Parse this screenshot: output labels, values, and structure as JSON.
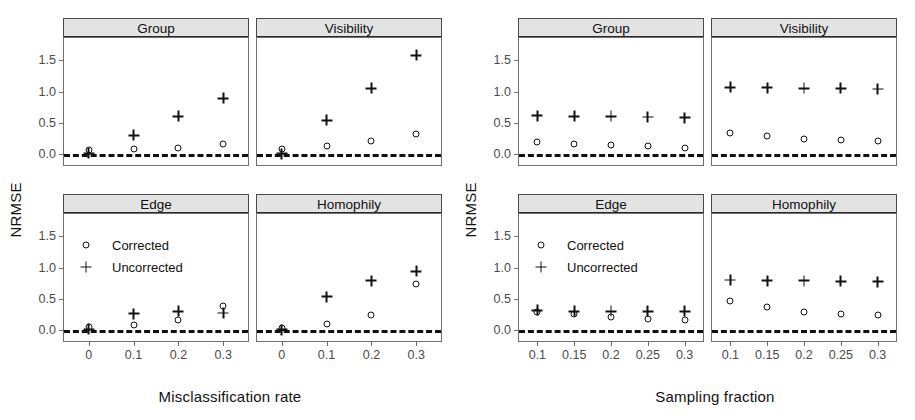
{
  "figure": {
    "width": 915,
    "height": 420,
    "background": "#ffffff",
    "foreground": "#111111",
    "strip_fill": "#e3e3e3"
  },
  "chart_data": [
    {
      "type": "scatter",
      "id": "misclassification",
      "title": "",
      "xlabel": "Misclassification rate",
      "ylabel": "NRMSE",
      "x": [
        0,
        0.1,
        0.2,
        0.3
      ],
      "xticklabels": [
        "0",
        "0.1",
        "0.2",
        "0.3"
      ],
      "yticks": [
        0.0,
        0.5,
        1.0,
        1.5
      ],
      "yticklabels": [
        "0.0",
        "0.5",
        "1.0",
        "1.5"
      ],
      "ylim": [
        -0.18,
        1.86
      ],
      "xlim": [
        -0.055,
        0.355
      ],
      "grid": false,
      "legend_position": "Edge panel, upper left",
      "reference_line": {
        "y": 0,
        "style": "dashed"
      },
      "legend": [
        {
          "label": "Corrected",
          "marker": "circle"
        },
        {
          "label": "Uncorrected",
          "marker": "plus"
        }
      ],
      "panels": [
        {
          "name": "Group",
          "series": [
            {
              "name": "Corrected",
              "marker": "circle",
              "values": [
                0.06,
                0.08,
                0.1,
                0.15
              ]
            },
            {
              "name": "Uncorrected",
              "marker": "plus",
              "values": [
                0.01,
                0.3,
                0.6,
                0.89
              ]
            }
          ]
        },
        {
          "name": "Visibility",
          "series": [
            {
              "name": "Corrected",
              "marker": "circle",
              "values": [
                0.08,
                0.13,
                0.2,
                0.32
              ]
            },
            {
              "name": "Uncorrected",
              "marker": "plus",
              "values": [
                0.0,
                0.54,
                1.05,
                1.58
              ]
            }
          ]
        },
        {
          "name": "Edge",
          "series": [
            {
              "name": "Corrected",
              "marker": "circle",
              "values": [
                0.04,
                0.07,
                0.15,
                0.38
              ]
            },
            {
              "name": "Uncorrected",
              "marker": "plus",
              "values": [
                0.01,
                0.26,
                0.3,
                0.27
              ]
            }
          ]
        },
        {
          "name": "Homophily",
          "series": [
            {
              "name": "Corrected",
              "marker": "circle",
              "values": [
                0.03,
                0.1,
                0.24,
                0.73
              ]
            },
            {
              "name": "Uncorrected",
              "marker": "plus",
              "values": [
                0.0,
                0.53,
                0.79,
                0.94
              ]
            }
          ]
        }
      ]
    },
    {
      "type": "scatter",
      "id": "sampling",
      "title": "",
      "xlabel": "Sampling fraction",
      "ylabel": "NRMSE",
      "x": [
        0.1,
        0.15,
        0.2,
        0.25,
        0.3
      ],
      "xticklabels": [
        "0.1",
        "0.15",
        "0.2",
        "0.25",
        "0.3"
      ],
      "yticks": [
        0.0,
        0.5,
        1.0,
        1.5
      ],
      "yticklabels": [
        "0.0",
        "0.5",
        "1.0",
        "1.5"
      ],
      "ylim": [
        -0.18,
        1.86
      ],
      "xlim": [
        0.075,
        0.325
      ],
      "grid": false,
      "legend_position": "Edge panel, upper left",
      "reference_line": {
        "y": 0,
        "style": "dashed"
      },
      "legend": [
        {
          "label": "Corrected",
          "marker": "circle"
        },
        {
          "label": "Uncorrected",
          "marker": "plus"
        }
      ],
      "panels": [
        {
          "name": "Group",
          "series": [
            {
              "name": "Corrected",
              "marker": "circle",
              "values": [
                0.19,
                0.16,
                0.14,
                0.12,
                0.1
              ]
            },
            {
              "name": "Uncorrected",
              "marker": "plus",
              "values": [
                0.61,
                0.6,
                0.6,
                0.59,
                0.58
              ]
            }
          ]
        },
        {
          "name": "Visibility",
          "series": [
            {
              "name": "Corrected",
              "marker": "circle",
              "values": [
                0.34,
                0.28,
                0.24,
                0.22,
                0.2
              ]
            },
            {
              "name": "Uncorrected",
              "marker": "plus",
              "values": [
                1.07,
                1.06,
                1.05,
                1.05,
                1.04
              ]
            }
          ]
        },
        {
          "name": "Edge",
          "series": [
            {
              "name": "Corrected",
              "marker": "circle",
              "values": [
                0.29,
                0.25,
                0.2,
                0.17,
                0.15
              ]
            },
            {
              "name": "Uncorrected",
              "marker": "plus",
              "values": [
                0.31,
                0.3,
                0.3,
                0.3,
                0.3
              ]
            }
          ]
        },
        {
          "name": "Homophily",
          "series": [
            {
              "name": "Corrected",
              "marker": "circle",
              "values": [
                0.46,
                0.36,
                0.29,
                0.25,
                0.23
              ]
            },
            {
              "name": "Uncorrected",
              "marker": "plus",
              "values": [
                0.8,
                0.79,
                0.79,
                0.78,
                0.77
              ]
            }
          ]
        }
      ]
    }
  ]
}
